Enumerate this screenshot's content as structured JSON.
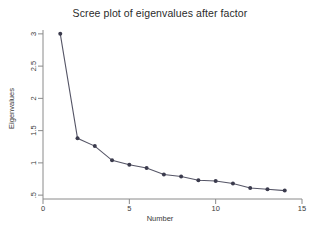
{
  "chart_data": {
    "type": "line",
    "title": "Scree plot of eigenvalues after factor",
    "xlabel": "Number",
    "ylabel": "Eigenvalues",
    "x": [
      1,
      2,
      3,
      4,
      5,
      6,
      7,
      8,
      9,
      10,
      11,
      12,
      13,
      14
    ],
    "values": [
      3.0,
      1.38,
      1.26,
      1.04,
      0.97,
      0.92,
      0.82,
      0.79,
      0.73,
      0.72,
      0.68,
      0.61,
      0.59,
      0.57
    ],
    "series": [
      {
        "name": "Eigenvalues",
        "values": [
          3.0,
          1.38,
          1.26,
          1.04,
          0.97,
          0.92,
          0.82,
          0.79,
          0.73,
          0.72,
          0.68,
          0.61,
          0.59,
          0.57
        ]
      }
    ],
    "xlim": [
      0,
      15
    ],
    "ylim": [
      0.44,
      3.06
    ],
    "xticks": [
      0,
      5,
      10,
      15
    ],
    "xticklabels": [
      "0",
      "5",
      "10",
      "15"
    ],
    "yticks": [
      0.5,
      1,
      1.5,
      2,
      2.5,
      3
    ],
    "yticklabels": [
      ".5",
      "1",
      "1.5",
      "2",
      "2.5",
      "3"
    ],
    "grid": false,
    "legend": "none",
    "marker": "filled-circle",
    "line_color": "#555566",
    "marker_color": "#3b3b4d",
    "background": "#ffffff"
  }
}
